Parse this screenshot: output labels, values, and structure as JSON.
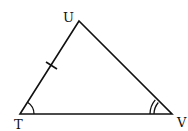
{
  "diagram": {
    "type": "triangle",
    "vertices": [
      {
        "name": "U",
        "x": 79,
        "y": 21
      },
      {
        "name": "T",
        "x": 20,
        "y": 114
      },
      {
        "name": "V",
        "x": 172,
        "y": 114
      }
    ],
    "labels": {
      "U": "U",
      "T": "T",
      "V": "V"
    },
    "marks": {
      "side_TU_tick": 1,
      "angle_T_arcs": 1,
      "angle_V_arcs": 2
    },
    "stroke_color": "#111111"
  }
}
